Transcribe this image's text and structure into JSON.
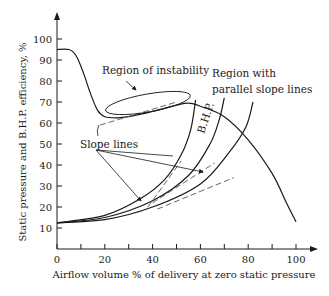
{
  "chart_data": {
    "type": "line",
    "title": "",
    "xlabel": "Airflow volume % of delivery at zero static pressure",
    "ylabel": "Static pressure and B.H.P. efficiency, %",
    "xlim": [
      0,
      100
    ],
    "ylim": [
      0,
      105
    ],
    "grid": false,
    "x_ticks": [
      0,
      20,
      40,
      60,
      80,
      100
    ],
    "x_minor_ticks": [
      10,
      30,
      50,
      70,
      90
    ],
    "x_tick_labels": [
      "0",
      "20",
      "40",
      "60",
      "80",
      "100"
    ],
    "y_ticks": [
      10,
      20,
      30,
      40,
      50,
      60,
      70,
      80,
      90,
      100
    ],
    "y_tick_labels": [
      "10",
      "20",
      "30",
      "40",
      "50",
      "60",
      "70",
      "80",
      "90",
      "100"
    ],
    "series": [
      {
        "name": "Static pressure",
        "x": [
          0,
          5,
          8,
          11,
          14,
          17,
          20,
          25,
          30,
          40,
          50,
          55,
          60,
          70,
          80,
          90,
          96,
          100
        ],
        "y": [
          95,
          95,
          92,
          84,
          74,
          66,
          63,
          62.5,
          63,
          65.5,
          68.5,
          69.5,
          68,
          63,
          52,
          36,
          22,
          13
        ]
      },
      {
        "name": "B.H.P. curve 1",
        "x": [
          0,
          20,
          35,
          45,
          52,
          56,
          58
        ],
        "y": [
          12.5,
          16,
          24,
          33,
          45,
          57,
          71
        ]
      },
      {
        "name": "B.H.P. curve 2",
        "x": [
          0,
          20,
          40,
          55,
          64,
          68,
          70
        ],
        "y": [
          12.5,
          15,
          23,
          35,
          50,
          62,
          72
        ]
      },
      {
        "name": "B.H.P. curve 3",
        "x": [
          0,
          20,
          40,
          60,
          72,
          79,
          82
        ],
        "y": [
          12.5,
          14,
          20,
          31,
          46,
          58,
          70
        ]
      }
    ],
    "slope_lines": [
      {
        "x": [
          18,
          50
        ],
        "y": [
          59,
          70
        ]
      },
      {
        "x": [
          38,
          52
        ],
        "y": [
          20,
          42
        ]
      },
      {
        "x": [
          40,
          66
        ],
        "y": [
          22,
          41
        ]
      },
      {
        "x": [
          42,
          74
        ],
        "y": [
          19,
          34
        ]
      }
    ],
    "annotations": {
      "instability": "Region of instability",
      "parallel_line1": "Region with",
      "parallel_line2": "parallel slope lines",
      "slope_lines": "Slope lines",
      "bhp": "B.H.P."
    }
  }
}
